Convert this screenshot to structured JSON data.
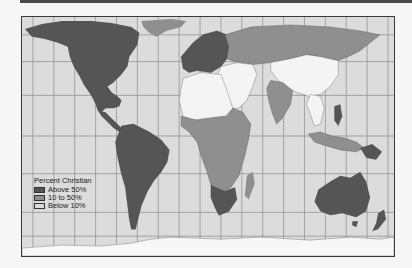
{
  "map": {
    "title": "Percent Christian",
    "projection": "Gall-Peters (equal-area)",
    "colors": {
      "ocean": "#dcdcdc",
      "grid": "#8a8a8a",
      "frame": "#3a3a3a",
      "above_50": "#555555",
      "between_10_50": "#8f8f8f",
      "below_10": "#f4f4f4",
      "antarctica": "#f7f7f7"
    }
  },
  "legend": {
    "title": "Percent Christian",
    "items": [
      {
        "label": "Above 50%",
        "color": "#555555"
      },
      {
        "label": "10 to 50%",
        "color": "#8f8f8f"
      },
      {
        "label": "Below 10%",
        "color": "#dadada"
      }
    ]
  },
  "regions": {
    "above_50": [
      "North America",
      "Central America",
      "South America",
      "Europe",
      "Southern Africa",
      "Philippines",
      "Papua New Guinea",
      "Australia",
      "New Zealand",
      "Greenland (partial)"
    ],
    "between_10_50": [
      "Russia",
      "Central Africa",
      "East Africa",
      "West Africa coast",
      "Kazakhstan",
      "India",
      "Indonesia (partial)",
      "Madagascar",
      "Korea",
      "Greenland"
    ],
    "below_10": [
      "North Africa",
      "Middle East",
      "China",
      "Mongolia",
      "Central Asia",
      "Southeast Asia mainland",
      "Antarctica"
    ]
  }
}
